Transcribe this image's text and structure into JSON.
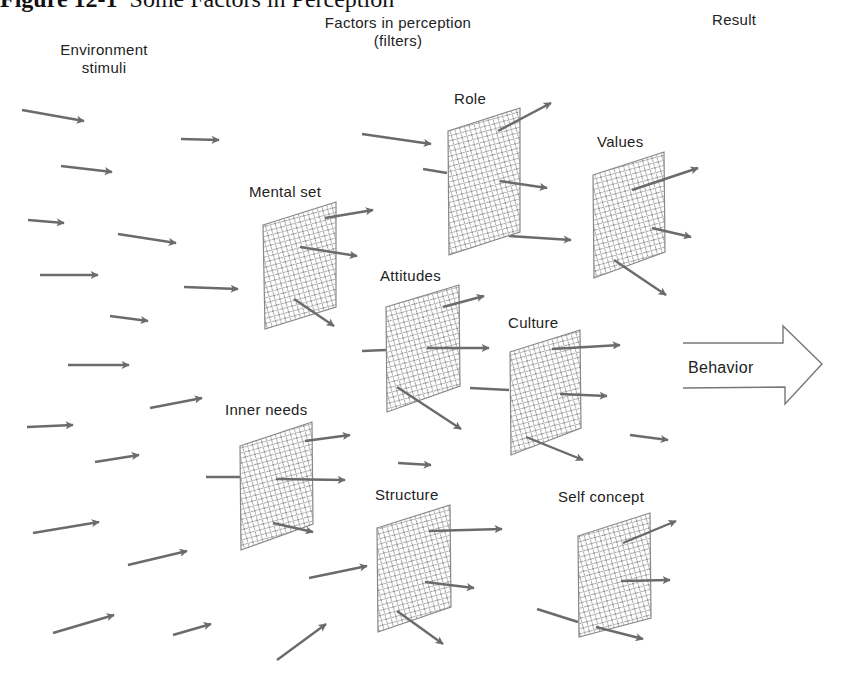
{
  "figure": {
    "title_bold": "Figure 12-1",
    "title_rest": "Some Factors in Perception"
  },
  "headers": {
    "environment": [
      "Environment",
      "stimuli"
    ],
    "factors": [
      "Factors in perception",
      "(filters)"
    ],
    "result": "Result"
  },
  "filters": [
    {
      "label": "Mental set"
    },
    {
      "label": "Role"
    },
    {
      "label": "Values"
    },
    {
      "label": "Attitudes"
    },
    {
      "label": "Culture"
    },
    {
      "label": "Inner needs"
    },
    {
      "label": "Structure"
    },
    {
      "label": "Self concept"
    }
  ],
  "result_arrow": {
    "label": "Behavior"
  },
  "colors": {
    "arrow": "#6b6b6b",
    "mesh": "#9a9a9a",
    "outline": "#777777"
  }
}
